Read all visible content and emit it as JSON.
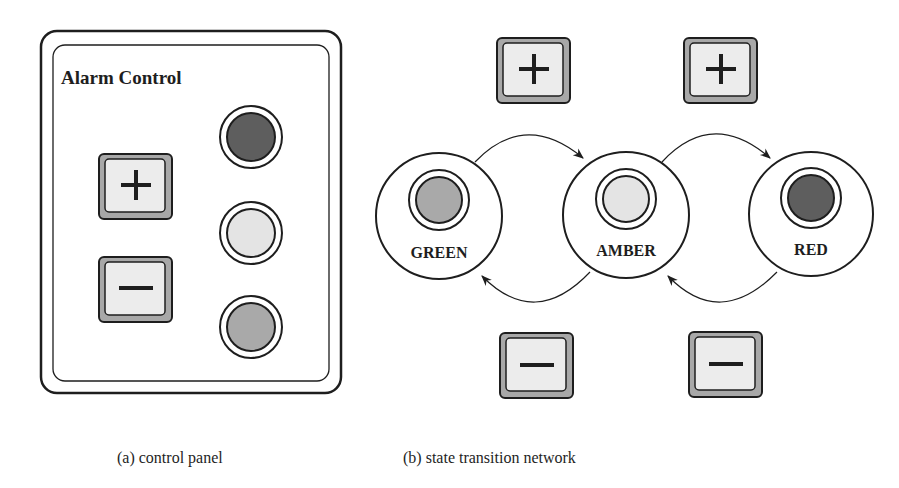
{
  "panel": {
    "title": "Alarm Control",
    "buttons": [
      {
        "name": "plus",
        "symbol": "+"
      },
      {
        "name": "minus",
        "symbol": "-"
      }
    ],
    "lights": [
      {
        "state": "red",
        "fill": "#5e5e5e"
      },
      {
        "state": "amber",
        "fill": "#e4e4e4"
      },
      {
        "state": "green",
        "fill": "#a9a9a9"
      }
    ],
    "caption": "(a) control panel"
  },
  "network": {
    "states": [
      {
        "label": "GREEN",
        "fill": "#a9a9a9"
      },
      {
        "label": "AMBER",
        "fill": "#e4e4e4"
      },
      {
        "label": "RED",
        "fill": "#5e5e5e"
      }
    ],
    "transitions": [
      {
        "from": "GREEN",
        "to": "AMBER",
        "trigger": "+"
      },
      {
        "from": "AMBER",
        "to": "RED",
        "trigger": "+"
      },
      {
        "from": "AMBER",
        "to": "GREEN",
        "trigger": "-"
      },
      {
        "from": "RED",
        "to": "AMBER",
        "trigger": "-"
      }
    ],
    "caption": "(b) state transition network"
  },
  "colors": {
    "stroke": "#1e1e1e",
    "button_face": "#ececec",
    "button_shadow": "#a8a8a8"
  }
}
